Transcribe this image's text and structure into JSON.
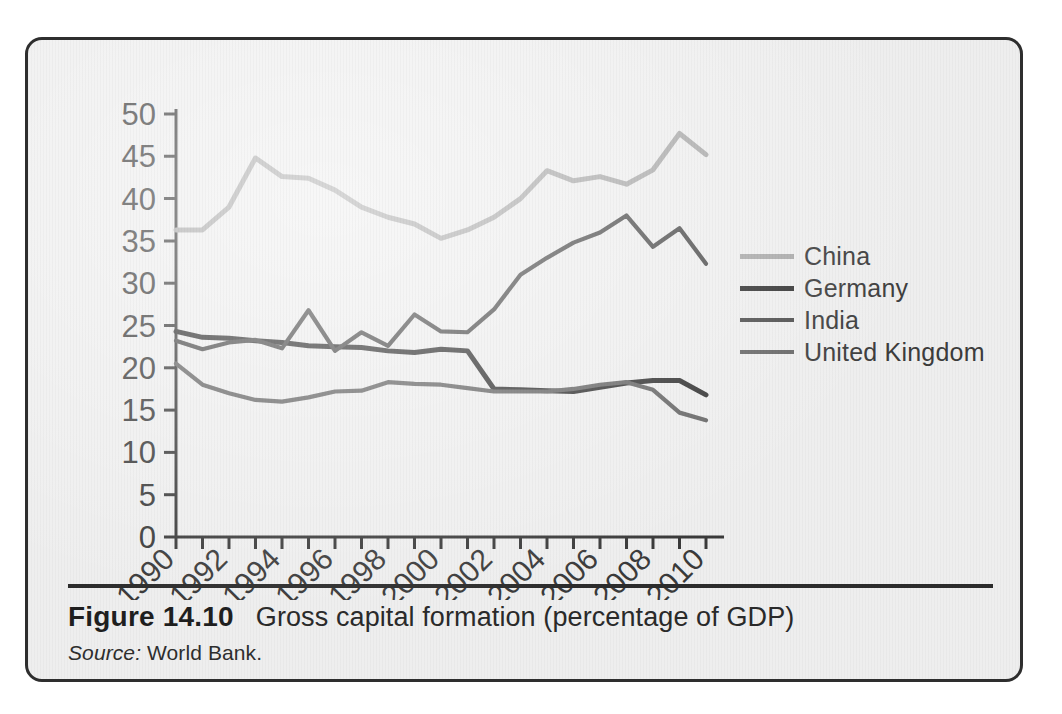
{
  "figure": {
    "number": "Figure 14.10",
    "title": "Gross capital formation (percentage of GDP)",
    "source_label": "Source:",
    "source_value": "World Bank."
  },
  "legend": {
    "items": [
      {
        "label": "China",
        "color": "#a9a9a9",
        "width": 5
      },
      {
        "label": "Germany",
        "color": "#333333",
        "width": 5
      },
      {
        "label": "India",
        "color": "#4d4d4d",
        "width": 4
      },
      {
        "label": "United Kingdom",
        "color": "#666666",
        "width": 4
      }
    ]
  },
  "chart_data": {
    "type": "line",
    "title": "Gross capital formation (percentage of GDP)",
    "xlabel": "",
    "ylabel": "",
    "xlim": [
      1990,
      2010
    ],
    "ylim": [
      0,
      50
    ],
    "ytick_step": 5,
    "yticks": [
      0,
      5,
      10,
      15,
      20,
      25,
      30,
      35,
      40,
      45,
      50
    ],
    "xticks_major": [
      1990,
      1992,
      1994,
      1996,
      1998,
      2000,
      2002,
      2004,
      2006,
      2008,
      2010
    ],
    "xticks_minor_every": 1,
    "xtick_label_rotation": -45,
    "grid": false,
    "legend_position": "right",
    "x": [
      1990,
      1991,
      1992,
      1993,
      1994,
      1995,
      1996,
      1997,
      1998,
      1999,
      2000,
      2001,
      2002,
      2003,
      2004,
      2005,
      2006,
      2007,
      2008,
      2009,
      2010
    ],
    "series": [
      {
        "name": "China",
        "color": "#a9a9a9",
        "values": [
          36.3,
          36.3,
          39.0,
          44.8,
          42.6,
          42.4,
          41.0,
          39.0,
          37.8,
          37.0,
          35.3,
          36.3,
          37.8,
          40.0,
          43.3,
          42.1,
          42.6,
          41.7,
          43.4,
          47.7,
          45.2
        ]
      },
      {
        "name": "Germany",
        "color": "#333333",
        "values": [
          24.3,
          23.6,
          23.5,
          23.2,
          23.0,
          22.6,
          22.5,
          22.4,
          22.0,
          21.8,
          22.2,
          22.0,
          17.5,
          17.4,
          17.3,
          17.2,
          17.7,
          18.2,
          18.5,
          18.5,
          16.8
        ]
      },
      {
        "name": "India",
        "color": "#4d4d4d",
        "values": [
          23.2,
          22.2,
          23.0,
          23.3,
          22.3,
          26.8,
          22.0,
          24.2,
          22.6,
          26.3,
          24.3,
          24.2,
          26.9,
          31.0,
          33.0,
          34.8,
          36.0,
          38.0,
          34.3,
          36.5,
          32.3
        ]
      },
      {
        "name": "United Kingdom",
        "color": "#666666",
        "values": [
          20.5,
          18.0,
          17.0,
          16.2,
          16.0,
          16.5,
          17.2,
          17.3,
          18.3,
          18.1,
          18.0,
          17.6,
          17.2,
          17.2,
          17.2,
          17.5,
          18.0,
          18.3,
          17.4,
          14.7,
          13.8
        ]
      }
    ]
  },
  "bleed_text": {
    "lines": [
      {
        "x": 60,
        "y": 74,
        "text": "rather than the growth rates of inputs and capital stock accumulation"
      },
      {
        "x": 60,
        "y": 100,
        "text": "ties the growth of TFP across the two periods. TFP growth was very"
      },
      {
        "x": 60,
        "y": 126,
        "text": "TFP growth in Korea contributed more than half the Korean production, "
      },
      {
        "x": 60,
        "y": 152,
        "text": "rate. It was the key mover in sustaining and accelerating the growth"
      },
      {
        "x": 60,
        "y": 178,
        "text": "and ensuring the flow of higher levels of activity over the decades"
      },
      {
        "x": 60,
        "y": 204,
        "text": "of other economies as well. Technological change is at the heart of the"
      },
      {
        "x": 60,
        "y": 230,
        "text": "of GDP. We note that the tempo of TFP growth was maintained at about"
      },
      {
        "x": 60,
        "y": 256,
        "text": "1.5 per cent per annum across both periods in Germany, and at a lower"
      },
      {
        "x": 60,
        "y": 282,
        "text": "level in the United Kingdom. The difference in these rates reflects"
      },
      {
        "x": 60,
        "y": 308,
        "text": "something about the structural changes in these economies, and"
      },
      {
        "x": 60,
        "y": 334,
        "text": "in the character of their industrial economy."
      },
      {
        "x": 60,
        "y": 386,
        "text": "In the same sense, we can now understand why productivity, theory and"
      },
      {
        "x": 60,
        "y": 412,
        "text": "fact. We are mostly concluding in a discussion of factor driven growth with only"
      },
      {
        "x": 60,
        "y": 438,
        "text": "the very beginning. As we shall see in the next chapter, developing"
      },
      {
        "x": 60,
        "y": 464,
        "text": "economies in particular have a great deal more scope to change and"
      },
      {
        "x": 60,
        "y": 490,
        "text": "attain much more rapid economic expansion."
      },
      {
        "x": 300,
        "y": 640,
        "text": "Economic growth accounting"
      }
    ]
  }
}
